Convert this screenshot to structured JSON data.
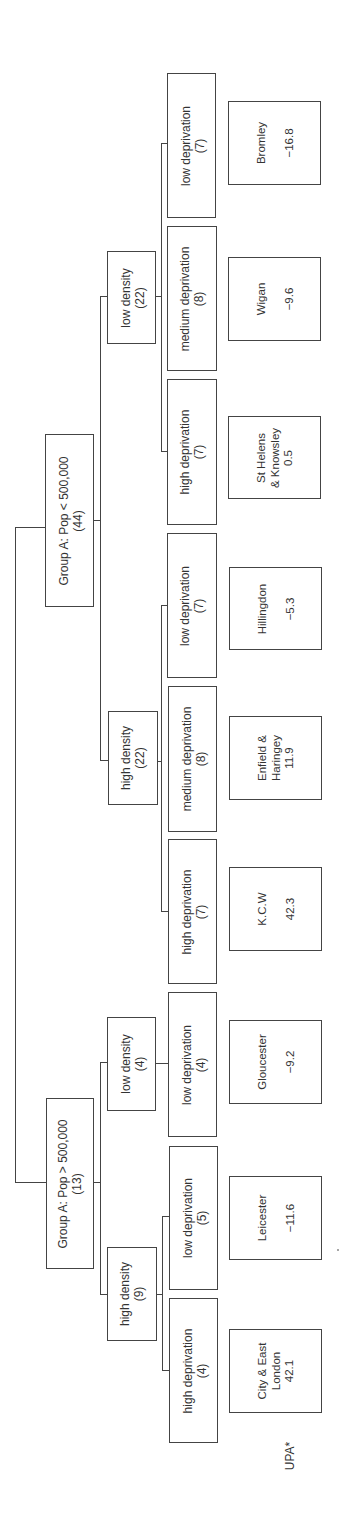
{
  "diagram": {
    "type": "tree",
    "orientation": "rotated-90-ccw",
    "root_label": "",
    "groups": [
      {
        "label": "Group A: Pop > 500,000",
        "count": "(13)",
        "densities": [
          {
            "label": "high density",
            "count": "(9)",
            "deprivations": [
              {
                "label": "high deprivation",
                "count": "(4)",
                "example": "City & East London",
                "value": "42.1"
              },
              {
                "label": "low deprivation",
                "count": "(5)",
                "example": "Leicester",
                "value": "−11.6"
              }
            ]
          },
          {
            "label": "low density",
            "count": "(4)",
            "deprivations": [
              {
                "label": "low deprivation",
                "count": "(4)",
                "example": "Gloucester",
                "value": "−9.2"
              }
            ]
          }
        ]
      },
      {
        "label": "Group A: Pop < 500,000",
        "count": "(44)",
        "densities": [
          {
            "label": "high density",
            "count": "(22)",
            "deprivations": [
              {
                "label": "high deprivation",
                "count": "(7)",
                "example": "K.C.W",
                "value": "42.3"
              },
              {
                "label": "medium deprivation",
                "count": "(8)",
                "example": "Enfield & Haringey",
                "example_lines": [
                  "Enfield &",
                  "Haringey"
                ],
                "value": "11.9"
              },
              {
                "label": "low deprivation",
                "count": "(7)",
                "example": "Hillingdon",
                "value": "−5.3"
              }
            ]
          },
          {
            "label": "low density",
            "count": "(22)",
            "deprivations": [
              {
                "label": "high deprivation",
                "count": "(7)",
                "example": "St Helens & Knowsley",
                "example_lines": [
                  "St Helens",
                  "& Knowsley"
                ],
                "value": "0.5"
              },
              {
                "label": "medium deprivation",
                "count": "(8)",
                "example": "Wigan",
                "value": "−9.6"
              },
              {
                "label": "low deprivation",
                "count": "(7)",
                "example": "Bromley",
                "value": "−16.8"
              }
            ]
          }
        ]
      }
    ],
    "row_label": "UPA*"
  },
  "view": {
    "g1": {
      "label": "Group A: Pop > 500,000",
      "count": "(13)"
    },
    "g2": {
      "label": "Group A: Pop < 500,000",
      "count": "(44)"
    },
    "g1_hd": {
      "label": "high density",
      "count": "(9)"
    },
    "g1_ld": {
      "label": "low density",
      "count": "(4)"
    },
    "g2_hd": {
      "label": "high density",
      "count": "(22)"
    },
    "g2_ld": {
      "label": "low density",
      "count": "(22)"
    },
    "g1_hd_high": {
      "label": "high deprivation",
      "count": "(4)"
    },
    "g1_hd_low": {
      "label": "low deprivation",
      "count": "(5)"
    },
    "g1_ld_low": {
      "label": "low deprivation",
      "count": "(4)"
    },
    "g2_hd_high": {
      "label": "high deprivation",
      "count": "(7)"
    },
    "g2_hd_med": {
      "label": "medium deprivation",
      "count": "(8)"
    },
    "g2_hd_low": {
      "label": "low deprivation",
      "count": "(7)"
    },
    "g2_ld_high": {
      "label": "high deprivation",
      "count": "(7)"
    },
    "g2_ld_med": {
      "label": "medium deprivation",
      "count": "(8)"
    },
    "g2_ld_low": {
      "label": "low deprivation",
      "count": "(7)"
    },
    "leaf_city": {
      "l1": "City & East",
      "l2": "London",
      "value": "42.1"
    },
    "leaf_leicester": {
      "l1": "Leicester",
      "value": "−11.6"
    },
    "leaf_gloucester": {
      "l1": "Gloucester",
      "value": "−9.2"
    },
    "leaf_kcw": {
      "l1": "K.C.W",
      "value": "42.3"
    },
    "leaf_enfield": {
      "l1": "Enfield &",
      "l2": "Haringey",
      "value": "11.9"
    },
    "leaf_hillingdon": {
      "l1": "Hillingdon",
      "value": "−5.3"
    },
    "leaf_sthelens": {
      "l1": "St Helens",
      "l2": "& Knowsley",
      "value": "0.5"
    },
    "leaf_wigan": {
      "l1": "Wigan",
      "value": "−9.6"
    },
    "leaf_bromley": {
      "l1": "Bromley",
      "value": "−16.8"
    },
    "upa_label": "UPA*"
  },
  "colors": {
    "line": "#444444",
    "text": "#333333",
    "background": "#ffffff"
  }
}
